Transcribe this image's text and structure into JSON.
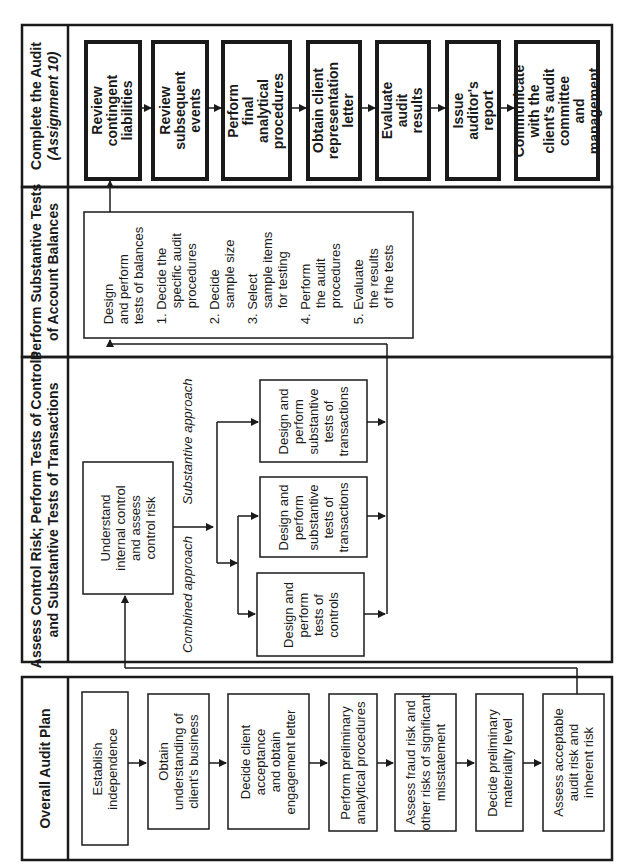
{
  "diagram": {
    "orientation": "rotated-90-ccw",
    "colors": {
      "line": "#1a1a1a",
      "background": "#ffffff"
    },
    "phases": [
      {
        "id": "complete",
        "title": "Complete the Audit",
        "subtitle": "(Assignment 10)",
        "steps": [
          "Review contingent liabilities",
          "Review subsequent events",
          "Perform final analytical procedures",
          "Obtain client representation letter",
          "Evaluate audit results",
          "Issue auditor's report",
          "Communicate with the client's audit committee and management"
        ]
      },
      {
        "id": "substantive-balances",
        "title": "Perform Substantive Tests",
        "title2": "of Account Balances",
        "box": {
          "heading_l1": "Design",
          "heading_l2": "and perform",
          "heading_l3": "tests of balances",
          "items": [
            {
              "n": "1.",
              "l1": "Decide the",
              "l2": "specific audit",
              "l3": "procedures"
            },
            {
              "n": "2.",
              "l1": "Decide",
              "l2": "sample size"
            },
            {
              "n": "3.",
              "l1": "Select",
              "l2": "sample items",
              "l3": "for testing"
            },
            {
              "n": "4.",
              "l1": "Perform",
              "l2": "the audit",
              "l3": "procedures"
            },
            {
              "n": "5.",
              "l1": "Evaluate",
              "l2": "the results",
              "l3": "of the tests"
            }
          ]
        }
      },
      {
        "id": "control-risk",
        "title": "Assess Control Risk; Perform Tests of Controls",
        "title2": "and Substantive Tests of Transactions",
        "understand_box": {
          "l1": "Understand",
          "l2": "internal control",
          "l3": "and assess",
          "l4": "control risk"
        },
        "labels": {
          "combined": "Combined approach",
          "substantive": "Substantive approach"
        },
        "boxes": [
          {
            "l1": "Design and",
            "l2": "perform",
            "l3": "tests of",
            "l4": "controls"
          },
          {
            "l1": "Design and",
            "l2": "perform",
            "l3": "substantive",
            "l4": "tests of",
            "l5": "transactions"
          },
          {
            "l1": "Design and",
            "l2": "perform",
            "l3": "substantive",
            "l4": "tests of",
            "l5": "transactions"
          }
        ]
      },
      {
        "id": "plan",
        "title": "Overall Audit Plan",
        "steps": [
          {
            "l1": "Establish",
            "l2": "independence"
          },
          {
            "l1": "Obtain",
            "l2": "understanding of",
            "l3": "client's business"
          },
          {
            "l1": "Decide client",
            "l2": "acceptance",
            "l3": "and obtain",
            "l4": "engagement letter"
          },
          {
            "l1": "Perform preliminary",
            "l2": "analytical procedures"
          },
          {
            "l1": "Assess fraud risk and",
            "l2": "other risks of significant",
            "l3": "misstatement"
          },
          {
            "l1": "Decide preliminary",
            "l2": "materiality level"
          },
          {
            "l1": "Assess acceptable",
            "l2": "audit risk and",
            "l3": "inherent risk"
          }
        ]
      }
    ]
  }
}
